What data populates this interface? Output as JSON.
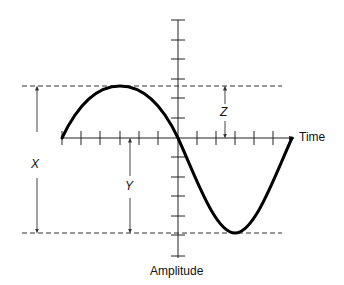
{
  "diagram": {
    "type": "sine-wave-amplitude-diagram",
    "axes": {
      "horizontal_label": "Time",
      "vertical_label": "Amplitude"
    },
    "measurements": [
      {
        "label": "X",
        "meaning": "peak-to-peak amplitude (between dashed lines)"
      },
      {
        "label": "Y",
        "meaning": "from time axis down to trough line"
      },
      {
        "label": "Z",
        "meaning": "from time axis up to peak line"
      }
    ],
    "colors": {
      "curve": "#000000",
      "axis": "#222222",
      "dashed": "#333333",
      "arrows": "#444444"
    }
  },
  "labels": {
    "time": "Time",
    "amplitude": "Amplitude",
    "x": "X",
    "y": "Y",
    "z": "Z"
  }
}
